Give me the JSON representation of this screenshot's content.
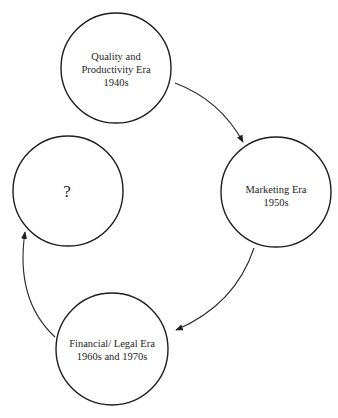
{
  "diagram": {
    "type": "cycle",
    "nodes": [
      {
        "id": "quality",
        "lines": [
          "Quality and",
          "Productivity Era",
          "1940s"
        ]
      },
      {
        "id": "marketing",
        "lines": [
          "Marketing Era",
          "1950s"
        ]
      },
      {
        "id": "financial",
        "lines": [
          "Financial/ Legal Era",
          "1960s and 1970s"
        ]
      },
      {
        "id": "unknown",
        "lines": [
          "?"
        ]
      }
    ],
    "edges": [
      {
        "from": "quality",
        "to": "marketing"
      },
      {
        "from": "marketing",
        "to": "financial"
      },
      {
        "from": "financial",
        "to": "unknown"
      }
    ],
    "colors": {
      "stroke": "#1e1e1e",
      "background": "#ffffff"
    }
  }
}
